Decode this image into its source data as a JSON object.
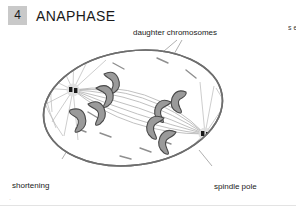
{
  "header": {
    "step_number": "4",
    "phase_title": "ANAPHASE",
    "badge_color": "#c9c9c9"
  },
  "labels": {
    "daughter_chromosomes": "daughter chromosomes",
    "shortening_kinetochore_microtubule_line1": "shortening",
    "shortening_kinetochore_microtubule_line2": "kinetochore",
    "shortening_kinetochore_microtubule_line3": "microtubule",
    "spindle_pole_line1": "spindle pole",
    "spindle_pole_line2": "moving outward"
  },
  "side_column": {
    "cut_off_text": "s\ne\nc\nt\ni\no\nn"
  },
  "corner_mark": "·",
  "diagram": {
    "type": "cell-division-anaphase",
    "cell": {
      "shape": "ellipse",
      "center_x": 133,
      "center_y": 108,
      "radius_x": 90,
      "radius_y": 57,
      "rotation_deg": -8,
      "outline_color": "#6e6e6e",
      "outline_width": 1.6,
      "fill": "#ffffff"
    },
    "spindle_poles": [
      {
        "name": "left-pole",
        "x": 73,
        "y": 90,
        "centriole_color": "#1a1a1a"
      },
      {
        "name": "right-pole",
        "x": 205,
        "y": 134,
        "centriole_color": "#1a1a1a"
      }
    ],
    "chromosomes": {
      "count_left": 4,
      "count_right": 4,
      "fill_color": "#9a9a9a",
      "stroke_color": "#4a4a4a",
      "shape": "v-shaped"
    },
    "microtubules": {
      "astral_color": "#b4b4b4",
      "kinetochore_color": "#b0b0b0",
      "free_microtubule_color": "#8f8f8f",
      "free_microtubule_count": 9
    },
    "leader_line_color": "#9a9a9a"
  }
}
